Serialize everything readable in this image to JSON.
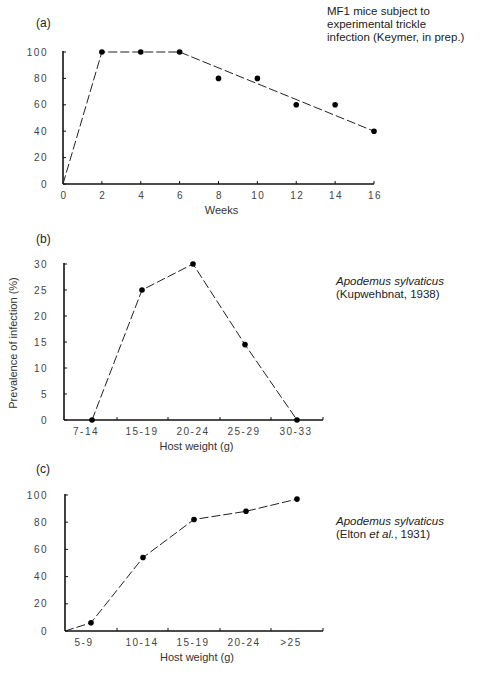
{
  "figure": {
    "caption_visible": "Figure 8.  (partially cut off caption text)",
    "panels": [
      {
        "label": "(a)",
        "note_lines": [
          "MF1 mice subject to",
          "experimental trickle",
          "infection (Keymer, in prep.)"
        ]
      },
      {
        "label": "(b)",
        "note_lines": [
          "Apodemus sylvaticus",
          "(Kupwehbnat, 1938)"
        ]
      },
      {
        "label": "(c)",
        "note_species": "Apodemus sylvaticus",
        "note_ref_pre": "(Elton ",
        "note_ref_ital": "et al.",
        "note_ref_post": ", 1931)"
      }
    ],
    "shared_ylabel": "Prevalence of infection (%)"
  },
  "chart_data": [
    {
      "id": "a",
      "type": "scatter",
      "title": "MF1 mice subject to experimental trickle infection (Keymer, in prep.)",
      "xlabel": "Weeks",
      "ylabel": "Prevalence of infection (%)",
      "xlim": [
        0,
        16
      ],
      "ylim": [
        0,
        100
      ],
      "x_ticks": [
        0,
        2,
        4,
        6,
        8,
        10,
        12,
        14,
        16
      ],
      "y_ticks": [
        0,
        20,
        40,
        60,
        80,
        100
      ],
      "points": {
        "x": [
          2,
          4,
          6,
          8,
          10,
          12,
          14,
          16
        ],
        "y": [
          100,
          100,
          100,
          80,
          80,
          60,
          60,
          40
        ]
      },
      "fit_line": {
        "style": "dashed",
        "x": [
          0,
          2,
          6,
          16
        ],
        "y": [
          0,
          100,
          100,
          40
        ]
      },
      "grid": false
    },
    {
      "id": "b",
      "type": "line",
      "title": "Apodemus sylvaticus (Kupwehbnat, 1938)",
      "xlabel": "Host weight (g)",
      "ylabel": "Prevalence of infection (%)",
      "categories": [
        "7-14",
        "15-19",
        "20-24",
        "25-29",
        "30-33"
      ],
      "values": [
        0,
        25,
        30,
        14.5,
        0
      ],
      "y_ticks": [
        0,
        5,
        10,
        15,
        20,
        25,
        30
      ],
      "ylim": [
        0,
        30
      ],
      "line_style": "dashed",
      "grid": false
    },
    {
      "id": "c",
      "type": "line",
      "title": "Apodemus sylvaticus (Elton et al., 1931)",
      "xlabel": "Host weight (g)",
      "ylabel": "Prevalence of infection (%)",
      "categories": [
        "5-9",
        "10-14",
        "15-19",
        "20-24",
        ">25"
      ],
      "values": [
        6,
        54,
        82,
        88,
        97
      ],
      "line_starts_at_origin": true,
      "y_ticks": [
        0,
        20,
        40,
        60,
        80,
        100
      ],
      "ylim": [
        0,
        100
      ],
      "line_style": "dashed",
      "grid": false
    }
  ]
}
